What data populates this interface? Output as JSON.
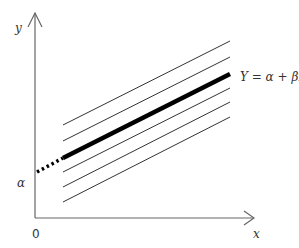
{
  "diagram": {
    "axes": {
      "x_label": "x",
      "y_label": "y",
      "origin_label": "0"
    },
    "intercept_label": "α",
    "regression_label": "Y = α + βx",
    "parallel_lines_count": 6,
    "colors": {
      "axis": "#555555",
      "line": "#333333",
      "thick": "#000000"
    }
  }
}
